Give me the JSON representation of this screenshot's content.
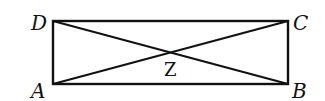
{
  "diagram": {
    "type": "rectangle-with-diagonals",
    "points": {
      "A": "A",
      "B": "B",
      "C": "C",
      "D": "D",
      "Z": "Z"
    },
    "segments": [
      "AB",
      "BC",
      "CD",
      "DA",
      "AC",
      "BD"
    ],
    "intersection": "Z"
  }
}
